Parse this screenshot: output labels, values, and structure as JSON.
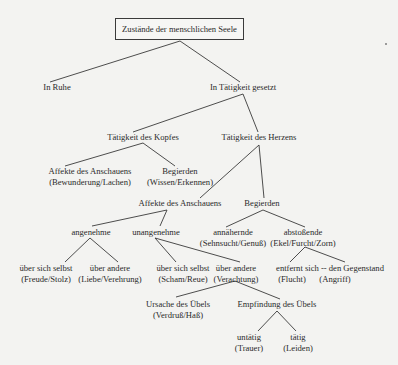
{
  "diagram": {
    "type": "tree",
    "root": "Zustände der menschlichen Seele",
    "nodes": {
      "in_ruhe": {
        "line1": "In Ruhe"
      },
      "in_taetigkeit": {
        "line1": "In Tätigkeit gesetzt"
      },
      "kopf": {
        "line1": "Tätigkeit des Kopfes"
      },
      "herz": {
        "line1": "Tätigkeit des Herzens"
      },
      "kopf_affekte": {
        "line1": "Affekte des Anschauens",
        "line2": "(Bewunderung/Lachen)"
      },
      "kopf_begierden": {
        "line1": "Begierden",
        "line2": "(Wissen/Erkennen)"
      },
      "herz_affekte": {
        "line1": "Affekte des Anschauens"
      },
      "herz_begierden": {
        "line1": "Begierden"
      },
      "angenehme": {
        "line1": "angenehme"
      },
      "unangenehme": {
        "line1": "unangenehme"
      },
      "annaehernde": {
        "line1": "annähernde",
        "line2": "(Sehnsucht/Genuß)"
      },
      "abstossende": {
        "line1": "abstoßende",
        "line2": "(Ekel/Furcht/Zorn)"
      },
      "ang_selbst": {
        "line1": "über sich selbst",
        "line2": "(Freude/Stolz)"
      },
      "ang_andere": {
        "line1": "über andere",
        "line2": "(Liebe/Verehrung)"
      },
      "unang_selbst": {
        "line1": "über sich selbst",
        "line2": "(Scham/Reue)"
      },
      "unang_andere": {
        "line1": "über andere",
        "line2": "(Verachtung)"
      },
      "entfernt": {
        "line1": "entfernt sich -- den Gegenstand",
        "flucht": "(Flucht)",
        "angriff": "(Angriff)"
      },
      "ursache": {
        "line1": "Ursache des Übels",
        "line2": "(Verdruß/Haß)"
      },
      "empfindung": {
        "line1": "Empfindung des Übels"
      },
      "untaetig": {
        "line1": "untätig",
        "line2": "(Trauer)"
      },
      "taetig": {
        "line1": "tätig",
        "line2": "(Leiden)"
      }
    },
    "edges": [
      [
        "root",
        "in_ruhe"
      ],
      [
        "root",
        "in_taetigkeit"
      ],
      [
        "in_taetigkeit",
        "kopf"
      ],
      [
        "in_taetigkeit",
        "herz"
      ],
      [
        "kopf",
        "kopf_affekte"
      ],
      [
        "kopf",
        "kopf_begierden"
      ],
      [
        "herz",
        "herz_affekte"
      ],
      [
        "herz",
        "herz_begierden"
      ],
      [
        "herz_affekte",
        "angenehme"
      ],
      [
        "herz_affekte",
        "unangenehme"
      ],
      [
        "herz_begierden",
        "annaehernde"
      ],
      [
        "herz_begierden",
        "abstossende"
      ],
      [
        "angenehme",
        "ang_selbst"
      ],
      [
        "angenehme",
        "ang_andere"
      ],
      [
        "unangenehme",
        "unang_selbst"
      ],
      [
        "unangenehme",
        "unang_andere"
      ],
      [
        "abstossende",
        "entfernt.flucht"
      ],
      [
        "abstossende",
        "entfernt.angriff"
      ],
      [
        "unang_andere",
        "ursache"
      ],
      [
        "unang_andere",
        "empfindung"
      ],
      [
        "empfindung",
        "untaetig"
      ],
      [
        "empfindung",
        "taetig"
      ]
    ]
  }
}
